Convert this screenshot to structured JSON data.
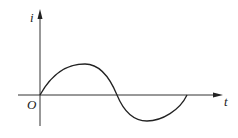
{
  "diagram": {
    "type": "sine-wave-graph",
    "axes": {
      "y_label": "i",
      "x_label": "t",
      "origin_label": "O"
    },
    "curve": {
      "description": "one full sine cycle starting at origin, positive half then negative half",
      "color": "#222222"
    },
    "colors": {
      "axis": "#333333",
      "curve": "#222222",
      "background": "#ffffff"
    }
  }
}
